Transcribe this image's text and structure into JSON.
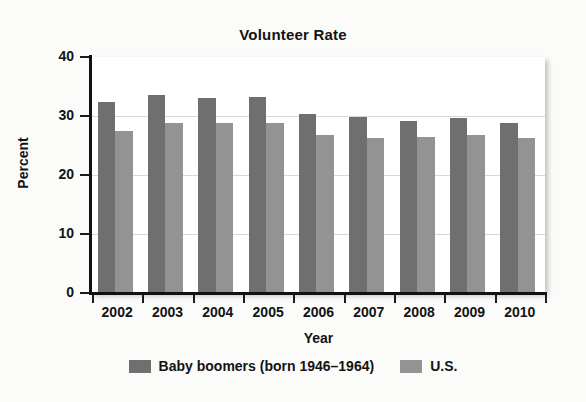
{
  "chart_data": {
    "type": "bar",
    "title": "Volunteer Rate",
    "xlabel": "Year",
    "ylabel": "Percent",
    "categories": [
      "2002",
      "2003",
      "2004",
      "2005",
      "2006",
      "2007",
      "2008",
      "2009",
      "2010"
    ],
    "series": [
      {
        "name": "Baby boomers (born 1946–1964)",
        "color": "#6f6f6f",
        "values": [
          32.3,
          33.5,
          33.0,
          33.2,
          30.4,
          29.8,
          29.2,
          29.7,
          28.8
        ]
      },
      {
        "name": "U.S.",
        "color": "#939393",
        "values": [
          27.4,
          28.8,
          28.8,
          28.8,
          26.7,
          26.2,
          26.4,
          26.8,
          26.3
        ]
      }
    ],
    "ylim": [
      0,
      40
    ],
    "yticks": [
      0,
      10,
      20,
      30,
      40
    ],
    "ytick_labels": [
      "0",
      "10",
      "20",
      "30",
      "40"
    ],
    "grid": "horizontal",
    "legend_position": "bottom"
  },
  "legend": {
    "entries": [
      {
        "label": "Baby boomers (born 1946–1964)",
        "color": "#6f6f6f"
      },
      {
        "label": "U.S.",
        "color": "#939393"
      }
    ]
  }
}
